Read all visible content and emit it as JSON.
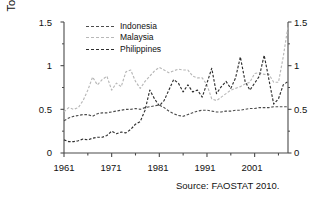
{
  "chart_data": {
    "type": "line",
    "title": "",
    "xlabel": "",
    "ylabel": "Tonnes/hectare",
    "xlim": [
      1961,
      2008
    ],
    "ylim": [
      0,
      1.5
    ],
    "grid": false,
    "legend_position": "top-left-inside",
    "x_ticks": [
      "1961",
      "1971",
      "1981",
      "1991",
      "2001"
    ],
    "x_tick_values": [
      1961,
      1971,
      1981,
      1991,
      2001
    ],
    "y_ticks": [
      "0",
      "0.5",
      "1",
      "1.5"
    ],
    "y_tick_values": [
      0,
      0.5,
      1,
      1.5
    ],
    "y_ticks_right": [
      "0",
      "0.5",
      "1",
      "1.5"
    ],
    "x": [
      1961,
      1962,
      1963,
      1964,
      1965,
      1966,
      1967,
      1968,
      1969,
      1970,
      1971,
      1972,
      1973,
      1974,
      1975,
      1976,
      1977,
      1978,
      1979,
      1980,
      1981,
      1982,
      1983,
      1984,
      1985,
      1986,
      1987,
      1988,
      1989,
      1990,
      1991,
      1992,
      1993,
      1994,
      1995,
      1996,
      1997,
      1998,
      1999,
      2000,
      2001,
      2002,
      2003,
      2004,
      2005,
      2006,
      2007,
      2008
    ],
    "series": [
      {
        "name": "Indonesia",
        "color": "#4d4d4d",
        "style": "dashed",
        "values": [
          0.37,
          0.4,
          0.42,
          0.43,
          0.44,
          0.44,
          0.42,
          0.45,
          0.46,
          0.46,
          0.47,
          0.48,
          0.49,
          0.5,
          0.5,
          0.51,
          0.5,
          0.52,
          0.53,
          0.54,
          0.55,
          0.52,
          0.48,
          0.45,
          0.43,
          0.42,
          0.44,
          0.46,
          0.48,
          0.49,
          0.49,
          0.48,
          0.47,
          0.47,
          0.48,
          0.48,
          0.49,
          0.49,
          0.5,
          0.51,
          0.51,
          0.52,
          0.52,
          0.52,
          0.53,
          0.53,
          0.53,
          0.53
        ]
      },
      {
        "name": "Malaysia",
        "color": "#b8b8b8",
        "style": "dashed",
        "values": [
          0.47,
          0.52,
          0.5,
          0.52,
          0.6,
          0.72,
          0.87,
          0.78,
          0.84,
          0.88,
          0.72,
          0.8,
          0.76,
          0.93,
          0.95,
          0.82,
          0.74,
          0.82,
          0.88,
          0.94,
          0.98,
          0.95,
          0.92,
          0.94,
          0.96,
          0.95,
          0.95,
          0.88,
          0.86,
          0.86,
          0.78,
          0.62,
          0.6,
          0.64,
          0.68,
          0.72,
          0.74,
          0.76,
          0.79,
          0.81,
          0.91,
          0.92,
          0.9,
          0.9,
          0.81,
          0.81,
          1.1,
          1.45
        ]
      },
      {
        "name": "Philippines",
        "color": "#2e2e2e",
        "style": "dashed",
        "values": [
          0.15,
          0.13,
          0.13,
          0.14,
          0.16,
          0.15,
          0.17,
          0.18,
          0.18,
          0.2,
          0.25,
          0.22,
          0.24,
          0.23,
          0.27,
          0.33,
          0.36,
          0.49,
          0.72,
          0.62,
          0.54,
          0.6,
          0.72,
          0.84,
          0.8,
          0.7,
          0.78,
          0.7,
          0.72,
          0.64,
          0.8,
          0.97,
          0.68,
          0.76,
          0.82,
          0.74,
          0.86,
          1.1,
          0.82,
          0.72,
          0.8,
          0.88,
          1.12,
          0.84,
          0.56,
          0.62,
          0.78,
          0.82
        ]
      }
    ],
    "source_note": "Source: FAOSTAT 2010."
  }
}
